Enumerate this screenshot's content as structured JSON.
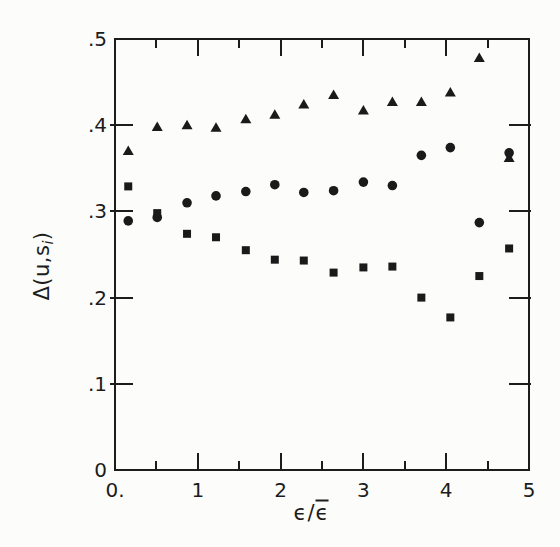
{
  "figure": {
    "background": "#fcfcfa",
    "ink": "#1c1c1c",
    "marker_color": "#1a1a1a"
  },
  "labels": {
    "y_prefix": "Δ(u,s",
    "y_sub": "i",
    "y_suffix": ")",
    "x_num": "ϵ",
    "x_slash": "/",
    "x_den": "ϵ"
  },
  "chart_data": {
    "type": "scatter",
    "title": "",
    "xlabel": "ϵ/ϵ̄",
    "ylabel": "Δ(u,s_i)",
    "xlim": [
      0,
      5
    ],
    "ylim": [
      0,
      0.5
    ],
    "grid": false,
    "legend": "none",
    "x_ticks": {
      "major": [
        {
          "value": 0,
          "label": "0."
        },
        {
          "value": 1,
          "label": "1"
        },
        {
          "value": 2,
          "label": "2"
        },
        {
          "value": 3,
          "label": "3"
        },
        {
          "value": 4,
          "label": "4"
        },
        {
          "value": 5,
          "label": "5"
        }
      ],
      "minor": [
        0.5,
        1.5,
        2.5,
        3.5,
        4.5
      ]
    },
    "y_ticks": {
      "major": [
        {
          "value": 0,
          "label": "0"
        },
        {
          "value": 0.1,
          "label": ".1"
        },
        {
          "value": 0.2,
          "label": ".2"
        },
        {
          "value": 0.3,
          "label": ".3"
        },
        {
          "value": 0.4,
          "label": ".4"
        },
        {
          "value": 0.5,
          "label": ".5"
        }
      ]
    },
    "x": [
      0.16,
      0.51,
      0.87,
      1.22,
      1.58,
      1.93,
      2.28,
      2.64,
      3.0,
      3.35,
      3.7,
      4.05,
      4.4,
      4.76
    ],
    "series": [
      {
        "name": "triangle-series",
        "marker": "triangle-up",
        "values": [
          0.37,
          0.398,
          0.4,
          0.397,
          0.407,
          0.412,
          0.424,
          0.435,
          0.417,
          0.427,
          0.427,
          0.438,
          0.478,
          0.362
        ]
      },
      {
        "name": "circle-series",
        "marker": "circle",
        "values": [
          0.289,
          0.293,
          0.31,
          0.318,
          0.323,
          0.331,
          0.322,
          0.324,
          0.334,
          0.33,
          0.365,
          0.374,
          0.287,
          0.368
        ]
      },
      {
        "name": "square-series",
        "marker": "square",
        "values": [
          0.329,
          0.298,
          0.274,
          0.27,
          0.255,
          0.244,
          0.243,
          0.229,
          0.235,
          0.236,
          0.2,
          0.177,
          0.225,
          0.257
        ]
      }
    ]
  }
}
